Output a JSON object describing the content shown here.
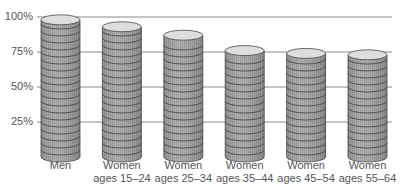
{
  "chart_data": {
    "type": "bar",
    "style": "3d-cylinder",
    "title": "",
    "xlabel": "",
    "ylabel": "",
    "ylim": [
      0,
      100
    ],
    "yticks": [
      "25%",
      "50%",
      "75%",
      "100%"
    ],
    "grid": true,
    "legend": null,
    "categories": [
      [
        "Men"
      ],
      [
        "Women",
        "ages 15–24"
      ],
      [
        "Women",
        "ages 25–34"
      ],
      [
        "Women",
        "ages 35–44"
      ],
      [
        "Women",
        "ages 45–54"
      ],
      [
        "Women",
        "ages 55–64"
      ]
    ],
    "values": [
      98,
      93,
      87,
      76,
      74,
      73
    ]
  },
  "colors": {
    "gridline": "#8a8a8a",
    "cylinder_body": "#a9a9a9",
    "cylinder_top": "#dedede",
    "band_line": "#4a4a4a",
    "text": "#555555"
  }
}
